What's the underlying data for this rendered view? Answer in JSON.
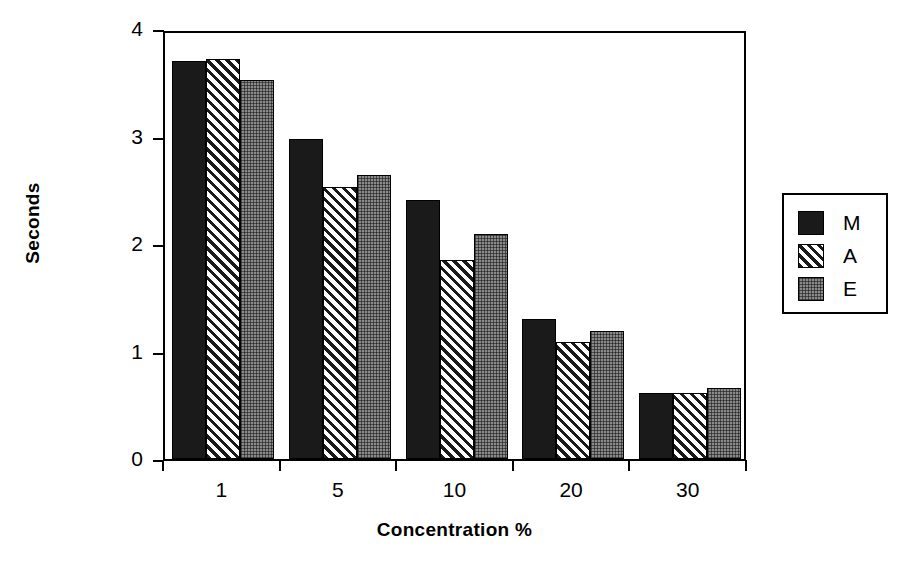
{
  "chart_data": {
    "type": "bar",
    "title": "",
    "xlabel": "Concentration %",
    "ylabel": "Seconds",
    "categories": [
      "1",
      "5",
      "10",
      "20",
      "30"
    ],
    "series": [
      {
        "name": "M",
        "fill": "solid",
        "values": [
          3.7,
          2.98,
          2.41,
          1.3,
          0.61
        ]
      },
      {
        "name": "A",
        "fill": "hatch",
        "values": [
          3.72,
          2.53,
          1.85,
          1.09,
          0.61
        ]
      },
      {
        "name": "E",
        "fill": "dots",
        "values": [
          3.53,
          2.64,
          2.09,
          1.19,
          0.66
        ]
      }
    ],
    "ylim": [
      0,
      4
    ],
    "yticks": [
      "0",
      "1",
      "2",
      "3",
      "4"
    ],
    "grid": false,
    "legend_position": "right"
  },
  "legend": {
    "entries": [
      {
        "label": "M"
      },
      {
        "label": "A"
      },
      {
        "label": "E"
      }
    ]
  },
  "colors": {
    "solid": "#1a1a1a",
    "hatch": "#ffffff",
    "dots": "#8a8a8a",
    "axis": "#000000",
    "background": "#ffffff"
  }
}
